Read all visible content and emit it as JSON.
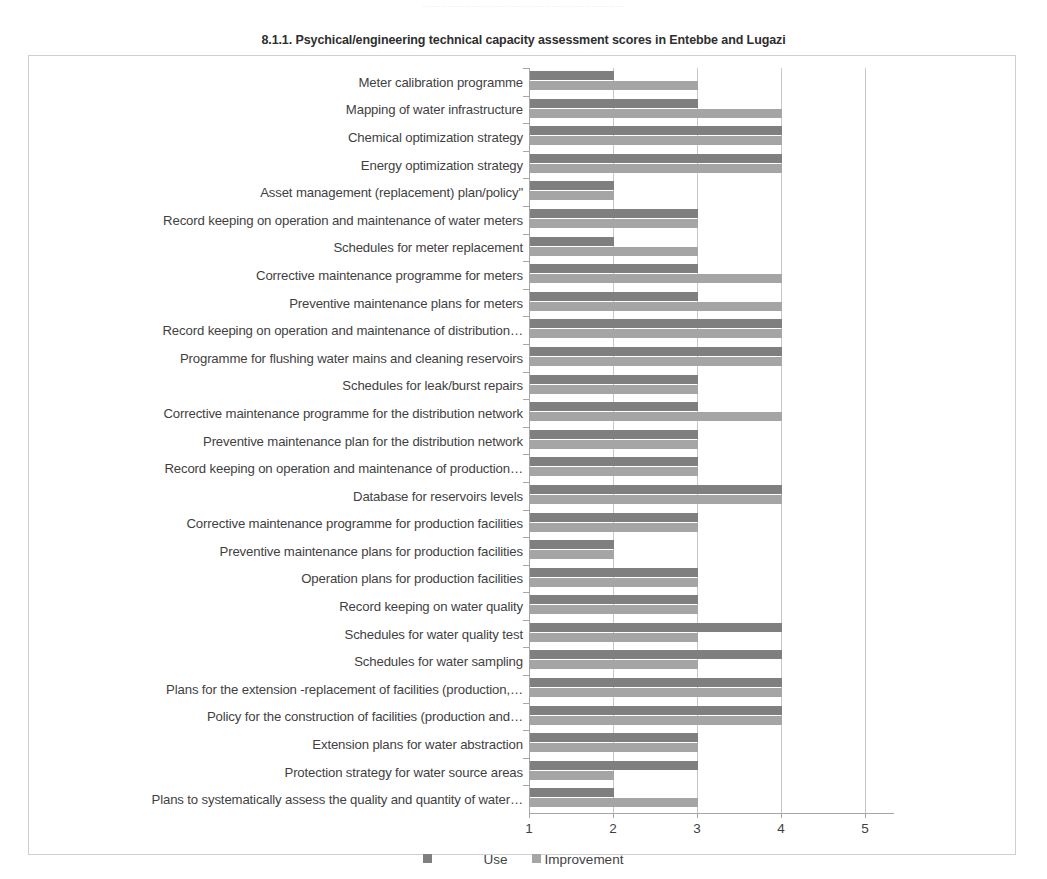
{
  "page": {
    "top_bleed_text": "··································································"
  },
  "chart_data": {
    "type": "bar",
    "orientation": "horizontal",
    "title": "8.1.1. Psychical/engineering technical capacity assessment scores in Entebbe and Lugazi",
    "xlabel": "",
    "ylabel": "",
    "xlim": [
      1,
      5
    ],
    "xticks": [
      "1",
      "2",
      "3",
      "4",
      "5"
    ],
    "grid": true,
    "legend_position": "bottom",
    "legend": [
      "Use",
      "Improvement"
    ],
    "colors": {
      "use": "#7f7f7f",
      "improvement": "#a5a5a5",
      "frame": "#cfcfcf",
      "axis": "#a6a6a6",
      "gridline": "#c8c8c8",
      "text": "#3f3f3f"
    },
    "categories": [
      "Meter calibration programme",
      "Mapping of water infrastructure",
      "Chemical optimization strategy",
      "Energy optimization strategy",
      "Asset management (replacement) plan/policy\"",
      "Record keeping on operation and maintenance of water meters",
      "Schedules for meter replacement",
      "Corrective maintenance programme for meters",
      "Preventive maintenance plans for meters",
      "Record keeping on operation and maintenance of distribution…",
      "Programme for flushing water mains and cleaning reservoirs",
      "Schedules for leak/burst repairs",
      "Corrective maintenance programme for the distribution network",
      "Preventive   maintenance plan for the distribution network",
      "Record keeping on operation and maintenance of production…",
      "Database for reservoirs levels",
      "Corrective maintenance programme for  production facilities",
      "Preventive maintenance plans for production facilities",
      "Operation plans for production facilities",
      "Record keeping on water quality",
      "Schedules for water quality test",
      "Schedules for water sampling",
      "Plans for the extension -replacement of facilities (production,…",
      "Policy for the construction of facilities (production and…",
      "Extension plans for water abstraction",
      "Protection strategy for water source areas",
      "Plans to systematically assess the  quality and quantity of water…"
    ],
    "series": [
      {
        "name": "Use",
        "values": [
          2,
          3,
          4,
          4,
          2,
          3,
          2,
          3,
          3,
          4,
          4,
          3,
          3,
          3,
          3,
          4,
          3,
          2,
          3,
          3,
          4,
          4,
          4,
          4,
          3,
          3,
          2
        ]
      },
      {
        "name": "Improvement",
        "values": [
          3,
          4,
          4,
          4,
          2,
          3,
          3,
          4,
          4,
          4,
          4,
          3,
          4,
          3,
          3,
          4,
          3,
          2,
          3,
          3,
          3,
          3,
          4,
          4,
          3,
          2,
          3
        ]
      }
    ]
  }
}
